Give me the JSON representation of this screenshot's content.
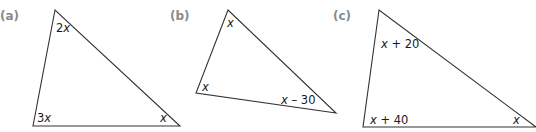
{
  "figures": [
    {
      "part_label": "(a)",
      "vertices": [
        [
          55,
          10
        ],
        [
          33,
          126
        ],
        [
          180,
          126
        ]
      ],
      "angles": [
        {
          "label_coef": "2",
          "label_var": "x",
          "label_rest": "",
          "x": 56,
          "y": 32
        },
        {
          "label_coef": "3",
          "label_var": "x",
          "label_rest": "",
          "x": 37,
          "y": 122
        },
        {
          "label_coef": "",
          "label_var": "x",
          "label_rest": "",
          "x": 160,
          "y": 122
        }
      ]
    },
    {
      "part_label": "(b)",
      "vertices": [
        [
          228,
          10
        ],
        [
          196,
          93
        ],
        [
          336,
          113
        ]
      ],
      "angles": [
        {
          "label_coef": "",
          "label_var": "x",
          "label_rest": "",
          "x": 227,
          "y": 27
        },
        {
          "label_coef": "",
          "label_var": "x",
          "label_rest": "",
          "x": 202,
          "y": 91
        },
        {
          "label_coef": "",
          "label_var": "x",
          "label_rest": " – 30",
          "x": 281,
          "y": 104
        }
      ]
    },
    {
      "part_label": "(c)",
      "vertices": [
        [
          379,
          10
        ],
        [
          363,
          127
        ],
        [
          536,
          127
        ]
      ],
      "angles": [
        {
          "label_coef": "",
          "label_var": "x",
          "label_rest": " + 20",
          "x": 381,
          "y": 48
        },
        {
          "label_coef": "",
          "label_var": "x",
          "label_rest": " + 40",
          "x": 370,
          "y": 124
        },
        {
          "label_coef": "",
          "label_var": "x",
          "label_rest": "",
          "x": 513,
          "y": 124
        }
      ]
    }
  ],
  "labels": {
    "a": "(a)",
    "b": "(b)",
    "c": "(c)"
  },
  "angle_text": {
    "a_top_coef": "2",
    "a_top_var": "x",
    "a_left_coef": "3",
    "a_left_var": "x",
    "a_right_var": "x",
    "b_top_var": "x",
    "b_left_var": "x",
    "b_right_var": "x",
    "b_right_rest": " – 30",
    "c_top_var": "x",
    "c_top_rest": " + 20",
    "c_left_var": "x",
    "c_left_rest": " + 40",
    "c_right_var": "x"
  },
  "colors": {
    "part_label": "#8a8a8a",
    "stroke": "#333333",
    "text": "#1a1a1a"
  }
}
